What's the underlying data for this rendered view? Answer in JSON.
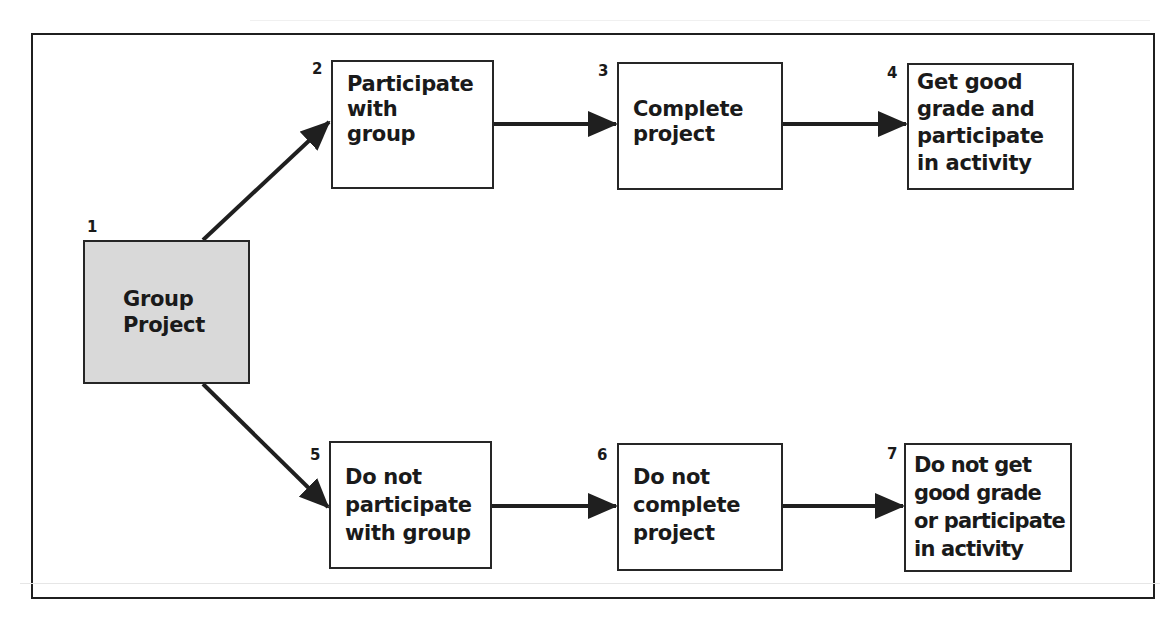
{
  "diagram": {
    "type": "flowchart",
    "colors": {
      "start_fill": "#d9d9d9",
      "box_fill": "#ffffff",
      "stroke": "#1f1f1f"
    },
    "nodes": [
      {
        "id": 1,
        "number": "1",
        "label": "Group\nProject",
        "style": "shaded"
      },
      {
        "id": 2,
        "number": "2",
        "label": "Participate\nwith\ngroup"
      },
      {
        "id": 3,
        "number": "3",
        "label": "Complete\nproject"
      },
      {
        "id": 4,
        "number": "4",
        "label": "Get good\ngrade and\nparticipate\nin activity"
      },
      {
        "id": 5,
        "number": "5",
        "label": "Do not\nparticipate\nwith group"
      },
      {
        "id": 6,
        "number": "6",
        "label": "Do not\ncomplete\nproject"
      },
      {
        "id": 7,
        "number": "7",
        "label": "Do not get\ngood grade\nor participate\nin activity"
      }
    ],
    "edges": [
      {
        "from": 1,
        "to": 2
      },
      {
        "from": 2,
        "to": 3
      },
      {
        "from": 3,
        "to": 4
      },
      {
        "from": 1,
        "to": 5
      },
      {
        "from": 5,
        "to": 6
      },
      {
        "from": 6,
        "to": 7
      }
    ]
  }
}
